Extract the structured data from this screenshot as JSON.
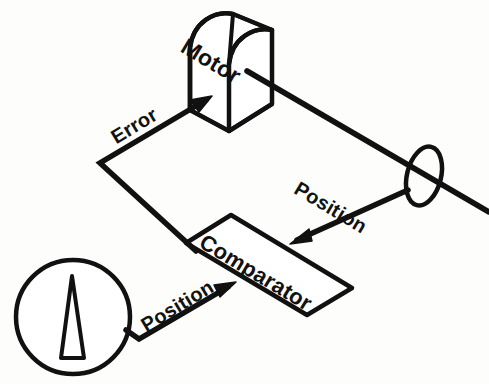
{
  "diagram": {
    "background_color": "#fdfdfc",
    "stroke_color": "#111111",
    "labels": {
      "motor": "Motor",
      "comparator": "Comparator",
      "error": "Error",
      "position_feedback": "Position",
      "position_command": "Position"
    },
    "nodes": [
      {
        "name": "motor",
        "shape": "isometric-arch-box",
        "label": "Motor"
      },
      {
        "name": "comparator",
        "shape": "isometric-parallelogram-plate",
        "label": "Comparator"
      },
      {
        "name": "position-sensor-disk",
        "shape": "ellipse-on-shaft",
        "label": ""
      },
      {
        "name": "command-dial",
        "shape": "circle-with-pointer",
        "label": ""
      },
      {
        "name": "output-shaft",
        "shape": "line",
        "label": ""
      }
    ],
    "signals": [
      {
        "name": "error-signal",
        "label": "Error",
        "from": "comparator",
        "to": "motor"
      },
      {
        "name": "position-feedback-signal",
        "label": "Position",
        "from": "position-sensor-disk",
        "to": "comparator"
      },
      {
        "name": "position-command-signal",
        "label": "Position",
        "from": "command-dial",
        "to": "comparator"
      }
    ]
  }
}
